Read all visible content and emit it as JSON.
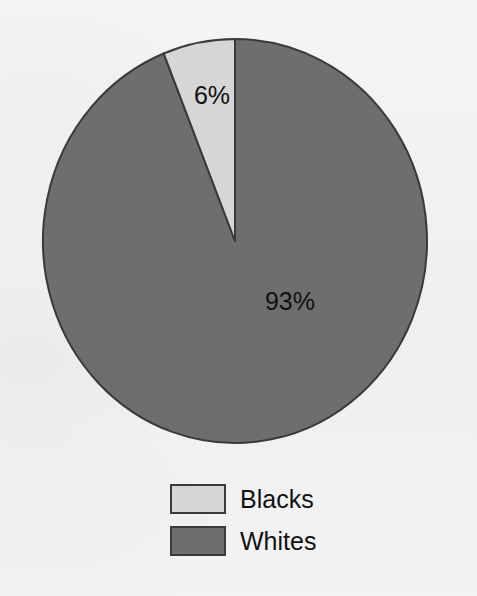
{
  "chart_data": {
    "type": "pie",
    "title": "",
    "subtitle": "",
    "xlabel": "",
    "ylabel": "",
    "grid": false,
    "legend_position": "bottom-left",
    "start_angle_deg": 0,
    "direction": "counterclockwise",
    "categories": [
      "Blacks",
      "Whites"
    ],
    "values": [
      6,
      93
    ],
    "data_labels": [
      "6%",
      "93%"
    ],
    "colors": [
      "#d6d6d6",
      "#6e6e6e"
    ],
    "slices": [
      {
        "name": "Blacks",
        "value": 6,
        "label": "6%",
        "color": "#d6d6d6",
        "label_x": 212,
        "label_y": 97
      },
      {
        "name": "Whites",
        "value": 93,
        "label": "93%",
        "color": "#6e6e6e",
        "label_x": 290,
        "label_y": 303
      }
    ],
    "legend": [
      {
        "label": "Blacks",
        "color": "#d6d6d6"
      },
      {
        "label": "Whites",
        "color": "#6e6e6e"
      }
    ],
    "annotations": []
  },
  "figure": {
    "background_color": "#f1f1f1",
    "outline_color": "#3a3a3a"
  },
  "pie": {
    "center_x": 235,
    "center_y": 241,
    "radius_x": 192,
    "radius_y": 202
  }
}
